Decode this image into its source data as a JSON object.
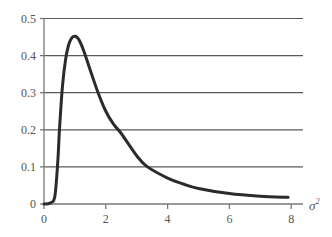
{
  "chart_data": {
    "type": "line",
    "title": "",
    "xlabel": "σ²",
    "ylabel": "",
    "xlim": [
      0,
      8.4
    ],
    "ylim": [
      0,
      0.5
    ],
    "grid": {
      "horizontal": true,
      "vertical": false
    },
    "x_ticks": [
      0,
      2,
      4,
      6,
      8
    ],
    "x_tick_labels": [
      "0",
      "2",
      "4",
      "6",
      "8"
    ],
    "y_ticks": [
      0,
      0.1,
      0.2,
      0.3,
      0.4,
      0.5
    ],
    "y_tick_labels": [
      "0",
      "0.1",
      "0.2",
      "0.3",
      "0.4",
      "0.5"
    ],
    "series": [
      {
        "name": "density",
        "x": [
          0.0,
          0.2,
          0.35,
          0.45,
          0.5,
          0.6,
          0.7,
          0.8,
          0.9,
          1.0,
          1.06,
          1.15,
          1.3,
          1.5,
          1.75,
          2.0,
          2.25,
          2.5,
          3.0,
          3.35,
          4.0,
          4.5,
          5.0,
          6.0,
          7.0,
          7.9
        ],
        "y": [
          0.0,
          0.003,
          0.02,
          0.12,
          0.2,
          0.32,
          0.39,
          0.43,
          0.448,
          0.452,
          0.45,
          0.44,
          0.41,
          0.36,
          0.3,
          0.25,
          0.215,
          0.19,
          0.13,
          0.1,
          0.07,
          0.054,
          0.042,
          0.028,
          0.021,
          0.018
        ]
      }
    ],
    "colors": {
      "curve": "#2b2b2b",
      "grid": "#5a5a5a",
      "axis": "#777777",
      "text": "#555555"
    }
  },
  "axes": {
    "x_label_text": "σ",
    "x_label_sup": "2"
  }
}
